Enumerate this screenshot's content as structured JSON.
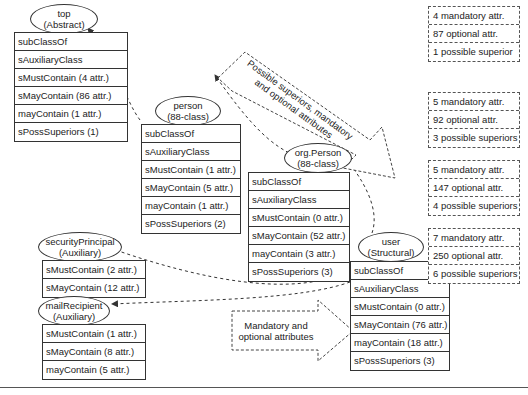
{
  "classes": [
    {
      "id": "top",
      "name": "top",
      "type": "(Abstract)",
      "rows": [
        "subClassOf",
        "sAuxiliaryClass",
        "sMustContain (4 attr.)",
        "sMayContain (86 attr.)",
        "mayContain (1 attr.)",
        "sPossSuperiors (1)"
      ]
    },
    {
      "id": "person",
      "name": "person",
      "type": "(88-class)",
      "rows": [
        "subClassOf",
        "sAuxiliaryClass",
        "sMustContain (1 attr.)",
        "sMayContain (5 attr.)",
        "mayContain (1 attr.)",
        "sPossSuperiors (2)"
      ]
    },
    {
      "id": "orgperson",
      "name": "org.Person",
      "type": "(88-class)",
      "rows": [
        "subClassOf",
        "sAuxiliaryClass",
        "sMustContain (0 attr.)",
        "sMayContain (52 attr.)",
        "mayContain (3 attr.)",
        "sPossSuperiors (3)"
      ]
    },
    {
      "id": "user",
      "name": "user",
      "type": "(Structural)",
      "rows": [
        "subClassOf",
        "sAuxiliaryClass",
        "sMustContain (0 attr.)",
        "sMayContain (76 attr.)",
        "mayContain (18 attr.)",
        "sPossSuperiors (3)"
      ]
    },
    {
      "id": "securityprincipal",
      "name": "securityPrincipal",
      "type": "(Auxiliary)",
      "rows": [
        "sMustContain (2 attr.)",
        "sMayContain (12 attr.)"
      ]
    },
    {
      "id": "mailrecipient",
      "name": "mailRecipient",
      "type": "(Auxiliary)",
      "rows": [
        "sMustContain (1 attr.)",
        "sMayContain (8 attr.)",
        "mayContain (5 attr.)"
      ]
    }
  ],
  "summaries": [
    {
      "rows": [
        "4 mandatory attr.",
        "87 optional attr.",
        "1 possible superior"
      ]
    },
    {
      "rows": [
        "5 mandatory attr.",
        "92 optional attr.",
        "3 possible superiors"
      ]
    },
    {
      "rows": [
        "5 mandatory attr.",
        "147 optional attr.",
        "4 possible superiors"
      ]
    },
    {
      "rows": [
        "7 mandatory attr.",
        "250 optional attr.",
        "6 possible superiors"
      ]
    }
  ],
  "arrows": {
    "diagonal": [
      "Possible superiors, mandatory",
      "and optional attributes"
    ],
    "horizontal": [
      "Mandatory and",
      "optional attributes"
    ]
  }
}
